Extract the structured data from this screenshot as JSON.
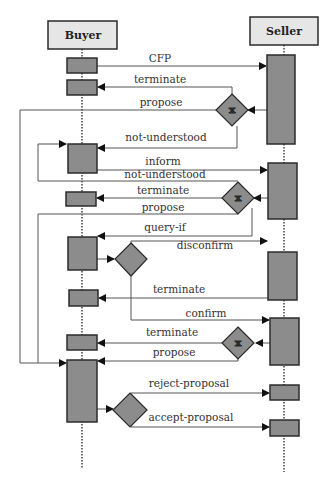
{
  "diagram": {
    "type": "AUML interaction protocol (sequence diagram)",
    "colors": {
      "role_box_fill": "#e6e6e6",
      "activation_fill": "#8c8c8c",
      "stroke": "#2b2b2b",
      "line": "#555555"
    },
    "roles": {
      "buyer": "Buyer",
      "seller": "Seller"
    },
    "messages": {
      "m1": "CFP",
      "m2": "terminate",
      "m3": "propose",
      "m4": "not-understood",
      "m5": "inform",
      "m6": "not-understood",
      "m7": "terminate",
      "m8": "propose",
      "m9": "query-if",
      "m10": "disconfirm",
      "m11": "terminate",
      "m12": "confirm",
      "m13": "terminate",
      "m14": "propose",
      "m15": "reject-proposal",
      "m16": "accept-proposal"
    },
    "decisions": {
      "xor": "X"
    }
  }
}
